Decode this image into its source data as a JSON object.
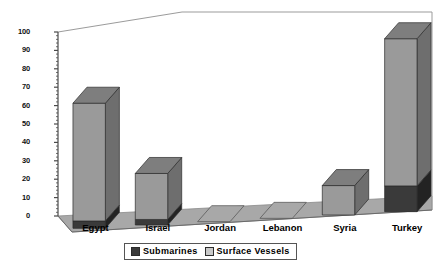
{
  "chart_data": {
    "type": "bar",
    "subtype": "stacked-column-3d",
    "title": "",
    "xlabel": "",
    "ylabel": "",
    "ylim": [
      0,
      100
    ],
    "ytick_step": 10,
    "yticks": [
      0,
      10,
      20,
      30,
      40,
      50,
      60,
      70,
      80,
      90,
      100
    ],
    "ytick_labels": [
      "0",
      "10",
      "20",
      "30",
      "40",
      "50",
      "60",
      "70",
      "80",
      "90",
      "100"
    ],
    "grid": false,
    "legend_position": "bottom",
    "categories": [
      "Egypt",
      "Israel",
      "Jordan",
      "Lebanon",
      "Syria",
      "Turkey"
    ],
    "series": [
      {
        "name": "Submarines",
        "color": "#3a3a3a",
        "values": [
          4,
          3,
          0,
          0,
          0,
          14
        ]
      },
      {
        "name": "Surface Vessels",
        "color": "#9a9a9a",
        "values": [
          64,
          25,
          0,
          0,
          16,
          80
        ]
      }
    ],
    "totals": [
      68,
      28,
      0,
      0,
      16,
      94
    ]
  },
  "legend": {
    "entries": [
      {
        "label": "Submarines",
        "swatch": "sub"
      },
      {
        "label": "Surface Vessels",
        "swatch": "surf"
      }
    ]
  },
  "colors": {
    "surface_front": "#9a9a9a",
    "surface_side": "#6e6e6e",
    "surface_top": "#7e7e7e",
    "sub_front": "#3a3a3a",
    "sub_side": "#232323",
    "sub_top": "#2c2c2c",
    "floor": "#a8a8a8",
    "floor_edge": "#8a8a8a",
    "frame_line": "#9b9b9b",
    "axis_line": "#4a4a4a"
  }
}
